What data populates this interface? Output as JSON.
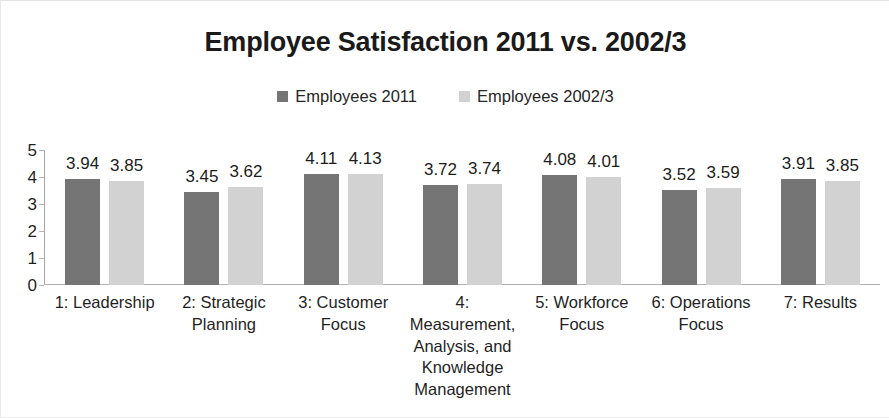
{
  "chart_data": {
    "type": "bar",
    "title": "Employee Satisfaction 2011 vs. 2002/3",
    "xlabel": "",
    "ylabel": "",
    "ylim": [
      0,
      5
    ],
    "yticks": [
      "5",
      "4",
      "3",
      "2",
      "1",
      "0"
    ],
    "grid": false,
    "legend_position": "top-center",
    "categories": [
      "1: Leadership",
      "2: Strategic Planning",
      "3: Customer Focus",
      "4: Measurement, Analysis, and Knowledge Management",
      "5: Workforce Focus",
      "6: Operations Focus",
      "7: Results"
    ],
    "series": [
      {
        "name": "Employees 2011",
        "color": "#757575",
        "values": [
          3.94,
          3.45,
          4.11,
          3.72,
          4.08,
          3.52,
          3.91
        ],
        "labels": [
          "3.94",
          "3.45",
          "4.11",
          "3.72",
          "4.08",
          "3.52",
          "3.91"
        ]
      },
      {
        "name": "Employees 2002/3",
        "color": "#d2d2d2",
        "values": [
          3.85,
          3.62,
          4.13,
          3.74,
          4.01,
          3.59,
          3.85
        ],
        "labels": [
          "3.85",
          "3.62",
          "4.13",
          "3.74",
          "4.01",
          "3.59",
          "3.85"
        ]
      }
    ]
  },
  "colors": {
    "series_2011": "#757575",
    "series_2002_3": "#d2d2d2",
    "axis": "#a6a6a6",
    "text": "#1f1f1f",
    "background": "#ffffff"
  }
}
